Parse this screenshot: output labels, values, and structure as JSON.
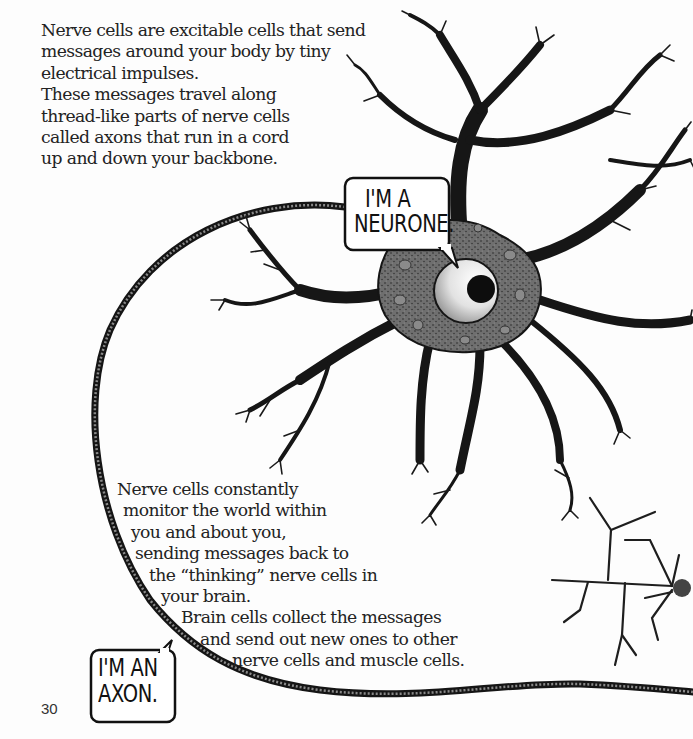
{
  "page": {
    "number": "30"
  },
  "intro_text": {
    "lines": [
      "Nerve cells are excitable cells that send",
      "messages around your body by tiny",
      "electrical impulses.",
      "These messages travel along",
      "thread-like parts of nerve cells",
      "called axons that run in a cord",
      "up and down your backbone."
    ]
  },
  "body_text": {
    "lines": [
      {
        "text": "Nerve cells constantly",
        "indent": 117
      },
      {
        "text": "monitor the world within",
        "indent": 123
      },
      {
        "text": "you and about you,",
        "indent": 131
      },
      {
        "text": "sending messages back to",
        "indent": 135
      },
      {
        "text": "the “thinking” nerve cells in",
        "indent": 149
      },
      {
        "text": "your brain.",
        "indent": 161
      },
      {
        "text": "Brain cells collect the messages",
        "indent": 181
      },
      {
        "text": "and send out new ones to other",
        "indent": 200
      },
      {
        "text": "nerve cells and muscle cells.",
        "indent": 232
      }
    ]
  },
  "speech_bubbles": {
    "neurone": {
      "line1": "I'M A",
      "line2": "NEURONE."
    },
    "axon": {
      "line1": "I'M AN",
      "line2": "AXON."
    }
  },
  "illustration": {
    "subject": "neurone-with-axon",
    "colors": {
      "ink": "#151515",
      "cytoplasm": "#6f6f6f",
      "organelle": "#8a8a8a",
      "nucleus_fill": "#e4e4e4",
      "nucleolus": "#0d0d0d",
      "axon_fill": "#3a3a3a"
    }
  }
}
